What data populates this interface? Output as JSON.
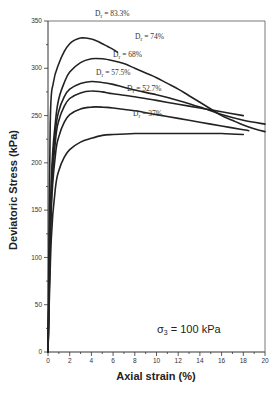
{
  "chart_data": {
    "type": "line",
    "title": "",
    "xlabel": "Axial strain (%)",
    "ylabel": "Deviatoric Stress (kPa)",
    "xlim": [
      0,
      20
    ],
    "ylim": [
      0,
      350
    ],
    "x_ticks": [
      0,
      2,
      4,
      6,
      8,
      10,
      12,
      14,
      16,
      18,
      20
    ],
    "y_ticks": [
      0,
      50,
      100,
      150,
      200,
      250,
      300,
      350
    ],
    "grid": false,
    "legend_position": "inline labels",
    "annotation": "σ3 = 100 kPa",
    "series": [
      {
        "name": "Dr = 83.3%",
        "label_base": "D",
        "label_sub": "r",
        "label_value": " = 83.3%",
        "x": [
          0,
          0.2,
          0.5,
          1.0,
          1.5,
          2.0,
          2.5,
          3.0,
          3.5,
          4.0,
          4.5,
          5.0,
          5.5,
          6.0,
          6.4
        ],
        "y": [
          0,
          240,
          285,
          305,
          318,
          326,
          330,
          332,
          332,
          331,
          329,
          326,
          323,
          320,
          317
        ]
      },
      {
        "name": "Dr = 74%",
        "label_base": "D",
        "label_sub": "r",
        "label_value": " = 74%",
        "x": [
          0,
          0.3,
          0.7,
          1.0,
          1.5,
          2.0,
          3.0,
          4.0,
          5.0,
          6.0,
          7.0,
          8.0,
          9.0,
          10.0,
          11.0,
          12.0,
          13.0,
          14.0,
          15.0,
          16.0,
          17.0,
          18.0,
          19.0,
          20.0
        ],
        "y": [
          0,
          180,
          245,
          268,
          285,
          296,
          306,
          310,
          310,
          308,
          305,
          300,
          295,
          290,
          284,
          278,
          271,
          264,
          257,
          250,
          245,
          240,
          236,
          233
        ]
      },
      {
        "name": "Dr = 68%",
        "label_base": "D",
        "label_sub": "r",
        "label_value": " = 68%",
        "x": [
          0,
          0.3,
          0.7,
          1.0,
          1.5,
          2.0,
          3.0,
          4.0,
          5.0,
          6.0,
          7.0,
          8.0,
          10.0,
          12.0,
          14.0,
          16.0,
          18.0,
          20.0
        ],
        "y": [
          0,
          170,
          235,
          255,
          270,
          278,
          284,
          286,
          285,
          283,
          280,
          277,
          272,
          266,
          259,
          251,
          245,
          241
        ]
      },
      {
        "name": "Dr = 57.5%",
        "label_base": "D",
        "label_sub": "r",
        "label_value": " = 57.5%",
        "x": [
          0,
          0.3,
          0.7,
          1.0,
          1.5,
          2.0,
          3.0,
          4.0,
          5.0,
          6.0,
          8.0,
          10.0,
          12.0,
          14.0,
          16.0,
          18.0
        ],
        "y": [
          0,
          160,
          225,
          245,
          260,
          268,
          274,
          276,
          275,
          273,
          270,
          266,
          262,
          258,
          254,
          250
        ]
      },
      {
        "name": "Dr = 52.7%",
        "label_base": "D",
        "label_sub": "r",
        "label_value": " = 52.7%",
        "x": [
          0,
          0.3,
          0.7,
          1.0,
          1.5,
          2.0,
          3.0,
          4.0,
          5.0,
          6.0,
          8.0,
          10.0,
          12.0,
          14.0,
          16.0,
          18.0,
          18.5
        ],
        "y": [
          0,
          150,
          210,
          228,
          243,
          251,
          257,
          259,
          259,
          258,
          255,
          251,
          247,
          243,
          239,
          235,
          234
        ]
      },
      {
        "name": "Dr = 37%",
        "label_base": "D",
        "label_sub": "r",
        "label_value": " = 37%",
        "x": [
          0,
          0.3,
          0.7,
          1.0,
          1.5,
          2.0,
          3.0,
          4.0,
          5.0,
          6.0,
          8.0,
          10.0,
          12.0,
          14.0,
          16.0,
          18.0
        ],
        "y": [
          0,
          120,
          175,
          192,
          206,
          214,
          222,
          226,
          229,
          230,
          231,
          231,
          231,
          231,
          231,
          230
        ]
      }
    ]
  },
  "labels": {
    "ylabel": "Deviatoric Stress (kPa)",
    "xlabel": "Axial strain (%)",
    "annotation_sigma": "σ",
    "annotation_sub": "3",
    "annotation_rest": " = 100 kPa"
  }
}
